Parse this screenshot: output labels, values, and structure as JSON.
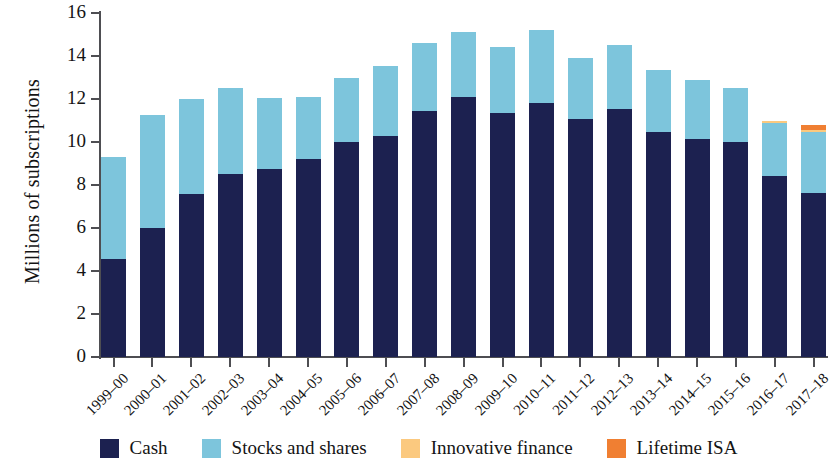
{
  "chart_data": {
    "type": "bar",
    "stacked": true,
    "title": "",
    "subtitle": "",
    "xlabel": "",
    "ylabel": "Millions of subscriptions",
    "ylim": [
      0,
      16
    ],
    "ytick_values": [
      0,
      2,
      4,
      6,
      8,
      10,
      12,
      14,
      16
    ],
    "ytick_labels": [
      "0",
      "2",
      "4",
      "6",
      "8",
      "10",
      "12",
      "14",
      "16"
    ],
    "grid": false,
    "legend_position": "bottom",
    "categories": [
      "1999–00",
      "2000–01",
      "2001–02",
      "2002–03",
      "2003–04",
      "2004–05",
      "2005–06",
      "2006–07",
      "2007–08",
      "2008–09",
      "2009–10",
      "2010–11",
      "2011–12",
      "2012–13",
      "2013–14",
      "2014–15",
      "2015–16",
      "2016–17",
      "2017–18"
    ],
    "series": [
      {
        "name": "Cash",
        "color": "#1c2150",
        "values": [
          4.55,
          6.0,
          7.6,
          8.5,
          8.75,
          9.2,
          10.0,
          10.3,
          11.45,
          12.1,
          11.35,
          11.8,
          11.05,
          11.55,
          10.45,
          10.15,
          10.0,
          8.4,
          7.65
        ]
      },
      {
        "name": "Stocks and shares",
        "color": "#7dc5dc",
        "values": [
          4.75,
          5.25,
          4.4,
          4.0,
          3.3,
          2.9,
          3.0,
          3.25,
          3.15,
          3.0,
          3.05,
          3.4,
          2.85,
          2.95,
          2.9,
          2.75,
          2.5,
          2.5,
          2.8
        ]
      },
      {
        "name": "Innovative finance",
        "color": "#fbc97f",
        "values": [
          0,
          0,
          0,
          0,
          0,
          0,
          0,
          0,
          0,
          0,
          0,
          0,
          0,
          0,
          0,
          0,
          0,
          0.1,
          0.1
        ]
      },
      {
        "name": "Lifetime ISA",
        "color": "#f07f32",
        "values": [
          0,
          0,
          0,
          0,
          0,
          0,
          0,
          0,
          0,
          0,
          0,
          0,
          0,
          0,
          0,
          0,
          0,
          0,
          0.25
        ]
      }
    ],
    "totals": [
      9.3,
      11.25,
      12.0,
      12.5,
      12.05,
      12.1,
      13.0,
      13.55,
      14.6,
      15.1,
      14.4,
      15.2,
      13.9,
      14.5,
      13.35,
      12.9,
      12.5,
      11.0,
      10.8
    ]
  },
  "legend": {
    "items": [
      {
        "label": "Cash",
        "color": "#1c2150"
      },
      {
        "label": "Stocks and shares",
        "color": "#7dc5dc"
      },
      {
        "label": "Innovative finance",
        "color": "#fbc97f"
      },
      {
        "label": "Lifetime ISA",
        "color": "#f07f32"
      }
    ]
  },
  "axes": {
    "y_title": "Millions of subscriptions"
  }
}
